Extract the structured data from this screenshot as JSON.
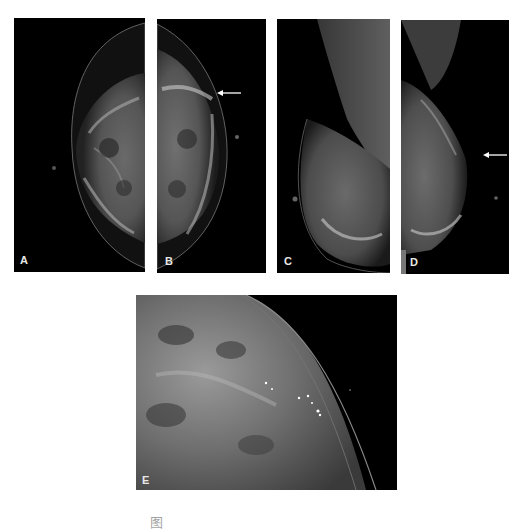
{
  "figure": {
    "panels": [
      {
        "id": "A",
        "label": "A",
        "view": "craniocaudal",
        "has_arrow": false
      },
      {
        "id": "B",
        "label": "B",
        "view": "craniocaudal",
        "has_arrow": true
      },
      {
        "id": "C",
        "label": "C",
        "view": "mediolateral oblique",
        "has_arrow": false
      },
      {
        "id": "D",
        "label": "D",
        "view": "mediolateral oblique",
        "has_arrow": true
      },
      {
        "id": "E",
        "label": "E",
        "view": "magnified detail with microcalcifications",
        "has_arrow": false
      }
    ],
    "caption": "图"
  },
  "colors": {
    "background": "#ffffff",
    "panel_background": "#000000",
    "label_color": "#e8e8e8",
    "arrow_color": "#ffffff"
  }
}
